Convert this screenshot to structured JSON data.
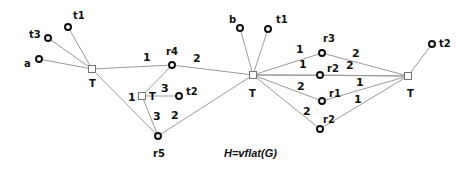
{
  "caption": "H=vflat(G)",
  "t_nodes": [
    {
      "id": "T_left",
      "label": "T",
      "x": 92,
      "y": 69
    },
    {
      "id": "T_inner",
      "label": "T",
      "x": 142,
      "y": 96
    },
    {
      "id": "T_mid",
      "label": "T",
      "x": 253,
      "y": 75
    },
    {
      "id": "T_right",
      "label": "T",
      "x": 408,
      "y": 76
    }
  ],
  "vertices": [
    {
      "id": "a",
      "label": "a",
      "x": 39,
      "y": 59
    },
    {
      "id": "t3",
      "label": "t3",
      "x": 48,
      "y": 38
    },
    {
      "id": "t1_left",
      "label": "t1",
      "x": 68,
      "y": 27
    },
    {
      "id": "r4",
      "label": "r4",
      "x": 172,
      "y": 65
    },
    {
      "id": "t2_inner",
      "label": "t2",
      "x": 179,
      "y": 96
    },
    {
      "id": "r5",
      "label": "r5",
      "x": 158,
      "y": 136
    },
    {
      "id": "b",
      "label": "b",
      "x": 240,
      "y": 28
    },
    {
      "id": "t1_mid",
      "label": "t1",
      "x": 268,
      "y": 29
    },
    {
      "id": "r3",
      "label": "r3",
      "x": 322,
      "y": 53
    },
    {
      "id": "r2_upper",
      "label": "r2",
      "x": 320,
      "y": 75
    },
    {
      "id": "r1",
      "label": "r1",
      "x": 322,
      "y": 101
    },
    {
      "id": "r2_lower",
      "label": "r2",
      "x": 320,
      "y": 129
    },
    {
      "id": "t2_right",
      "label": "t2",
      "x": 432,
      "y": 44
    }
  ],
  "edge_weights": {
    "w_Tleft_r4": "1",
    "w_r4_Tmid": "2",
    "w_Tinner_left": "1",
    "w_Tinner_r4": "3",
    "w_Tinner_r5": "3",
    "w_r5_Tmid": "2",
    "w_Tmid_r3": "1",
    "w_Tmid_r2u": "1",
    "w_Tmid_r1": "2",
    "w_Tmid_r2l": "2",
    "w_r3_Tright": "2",
    "w_r2u_Tright": "2",
    "w_r1_Tright_a": "1",
    "w_r1_Tright_b": "1"
  }
}
